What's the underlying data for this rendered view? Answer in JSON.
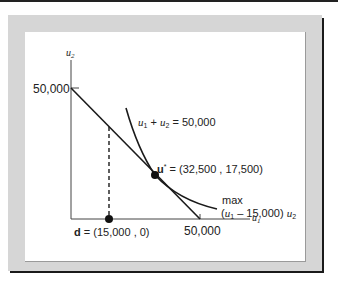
{
  "diagram": {
    "y_axis_label": "u",
    "y_axis_sub": "2",
    "x_axis_label": "u",
    "x_axis_sub": "1",
    "y_intercept_label": "50,000",
    "x_intercept_label": "50,000",
    "frontier_label": {
      "a": "u",
      "a_sub": "1",
      "plus": " + ",
      "b": "u",
      "b_sub": "2",
      "rest": " = 50,000"
    },
    "optimum": {
      "bold": "u",
      "star": "*",
      "rest": " = (32,500 , 17,500)"
    },
    "disagreement": {
      "bold": "d",
      "rest": " = (15,000 , 0)"
    },
    "objective": {
      "line1": "max",
      "open": "(",
      "var1": "u",
      "var1_sub": "1",
      "mid": " – 15,000) ",
      "var2": "u",
      "var2_sub": "2"
    },
    "colors": {
      "frame": "#d6d6d6",
      "shadow": "#1a1a1a",
      "ink": "#222222"
    }
  }
}
